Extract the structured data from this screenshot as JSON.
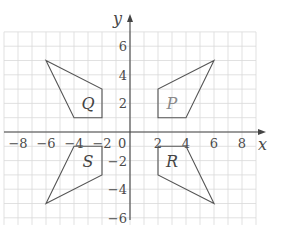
{
  "diagram": {
    "type": "coordinate-grid",
    "axes": {
      "x_label": "x",
      "y_label": "y",
      "x_ticks": [
        {
          "value": -8,
          "label": "−8"
        },
        {
          "value": -6,
          "label": "−6"
        },
        {
          "value": -4,
          "label": "−4"
        },
        {
          "value": -2,
          "label": "−2"
        },
        {
          "value": 2,
          "label": "2"
        },
        {
          "value": 4,
          "label": "4"
        },
        {
          "value": 6,
          "label": "6"
        },
        {
          "value": 8,
          "label": "8"
        }
      ],
      "y_ticks": [
        {
          "value": 6,
          "label": "6"
        },
        {
          "value": 4,
          "label": "4"
        },
        {
          "value": 2,
          "label": "2"
        },
        {
          "value": -2,
          "label": "−2"
        },
        {
          "value": -4,
          "label": "−4"
        },
        {
          "value": -6,
          "label": "−6"
        }
      ],
      "origin_label": "0",
      "x_range": [
        -9,
        9
      ],
      "y_range": [
        -6.5,
        7
      ],
      "grid": true
    },
    "shapes": [
      {
        "name": "P",
        "vertices": [
          [
            2,
            1
          ],
          [
            2,
            3
          ],
          [
            6,
            5
          ],
          [
            4,
            1
          ]
        ],
        "label_pos": [
          3,
          2
        ],
        "style": "light"
      },
      {
        "name": "Q",
        "vertices": [
          [
            -2,
            1
          ],
          [
            -2,
            3
          ],
          [
            -6,
            5
          ],
          [
            -4,
            1
          ]
        ],
        "label_pos": [
          -3,
          2
        ],
        "style": "dark"
      },
      {
        "name": "R",
        "vertices": [
          [
            2,
            -1
          ],
          [
            2,
            -3
          ],
          [
            6,
            -5
          ],
          [
            4,
            -1
          ]
        ],
        "label_pos": [
          3,
          -2
        ],
        "style": "dark"
      },
      {
        "name": "S",
        "vertices": [
          [
            -2,
            -1
          ],
          [
            -2,
            -3
          ],
          [
            -6,
            -5
          ],
          [
            -4,
            -1
          ]
        ],
        "label_pos": [
          -3,
          -2
        ],
        "style": "dark"
      }
    ]
  }
}
